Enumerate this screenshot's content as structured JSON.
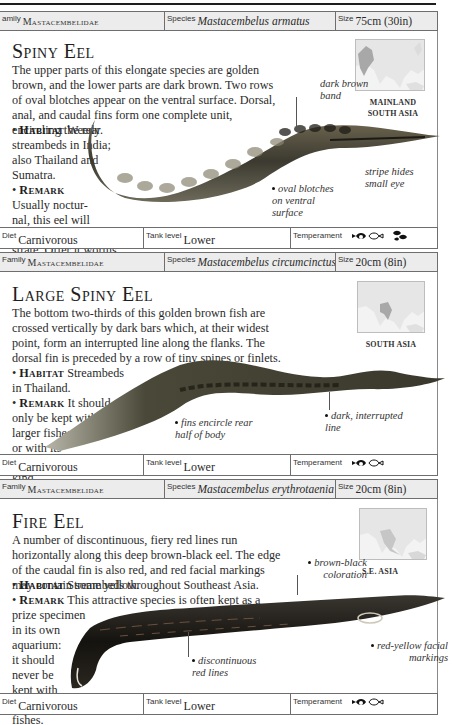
{
  "entries": [
    {
      "family_label": "amily",
      "family": "Mastacembelidae",
      "species_label": "Species",
      "species": "Mastacembelus armatus",
      "size_label": "Size",
      "size": "75cm (30in)",
      "title": "Spiny Eel",
      "description": "The upper parts of this elongate species are golden brown, and the lower parts are dark brown. Two rows of oval blotches appear on the ventral surface. Dorsal, anal, and caudal fins form one complete unit, encircling the rear.",
      "habitat_label": "Habitat",
      "habitat": "Weedy streambeds in India; also Thailand and Sumatra.",
      "remark_label": "Remark",
      "remark": "Usually nocturnal, this eel will burrow in the substrate. Offer it worms.",
      "region": "MAINLAND SOUTH ASIA",
      "callouts": [
        "dark brown band",
        "stripe hides small eye",
        "oval blotches on ventral surface"
      ],
      "diet_label": "Diet",
      "diet": "Carnivorous",
      "tank_label": "Tank level",
      "tank": "Lower",
      "temperament_label": "Temperament",
      "temperament_icons": [
        "fish-pair-icon",
        "fish-group-icon"
      ]
    },
    {
      "family_label": "Family",
      "family": "Mastacembelidae",
      "species_label": "Species",
      "species": "Mastacembelus circumcinctus",
      "size_label": "Size",
      "size": "20cm (8in)",
      "title": "Large Spiny Eel",
      "description": "The bottom two-thirds of this golden brown fish are crossed vertically by dark bars which, at their widest point, form an interrupted line along the flanks. The dorsal fin is preceded by a row of tiny spines or finlets.",
      "habitat_label": "Habitat",
      "habitat": "Streambeds in Thailand.",
      "remark_label": "Remark",
      "remark": "It should only be kept with larger fishes or with its own kind.",
      "region": "SOUTH ASIA",
      "callouts": [
        "fins encircle rear half of body",
        "dark, interrupted line"
      ],
      "diet_label": "Diet",
      "diet": "Carnivorous",
      "tank_label": "Tank level",
      "tank": "Lower",
      "temperament_label": "Temperament",
      "temperament_icons": [
        "fish-pair-icon"
      ]
    },
    {
      "family_label": "Family",
      "family": "Mastacembelidae",
      "species_label": "Species",
      "species": "Mastacembelus erythrotaenia",
      "size_label": "Size",
      "size": "20cm (8in)",
      "title": "Fire Eel",
      "description": "A number of discontinuous, fiery red lines run horizontally along this deep brown-black eel. The edge of the caudal fin is also red, and red facial markings may contain some yellow.",
      "habitat_label": "Habitat",
      "habitat": "Streambeds throughout Southeast Asia.",
      "remark_label": "Remark",
      "remark": "This attractive species is often kept as a prize specimen in its own aquarium: it should never be kept with smaller fishes.",
      "region": "S.E. ASIA",
      "callouts": [
        "brown-black coloration",
        "red-yellow facial markings",
        "discontinuous red lines"
      ],
      "diet_label": "Diet",
      "diet": "Carnivorous",
      "tank_label": "Tank level",
      "tank": "Lower",
      "temperament_label": "Temperament",
      "temperament_icons": [
        "fish-pair-icon"
      ]
    }
  ],
  "note_lines": {
    "e0_habitat": [
      "Weedy",
      "streambeds in India;",
      "also Thailand and",
      "Sumatra."
    ],
    "e0_remark": [
      "Usually noctur-",
      "nal, this eel will",
      "burrow in the sub-",
      "strate. Offer it worms."
    ],
    "e1_habitat": [
      "Streambeds",
      "in Thailand."
    ],
    "e1_remark": [
      "It should",
      "only be kept with",
      "larger fishes",
      "or with its",
      "own",
      "kind."
    ],
    "e2_remark": [
      "This attractive species is often kept as a",
      "prize specimen",
      "in its own",
      "aquarium:",
      "it should",
      "never be",
      "kept with",
      "smaller",
      "fishes."
    ]
  },
  "colors": {
    "header_bg": "#ececec",
    "border": "#6e6e6e",
    "map_land": "#e4e4e4",
    "map_highlight": "#a9a9a9"
  }
}
